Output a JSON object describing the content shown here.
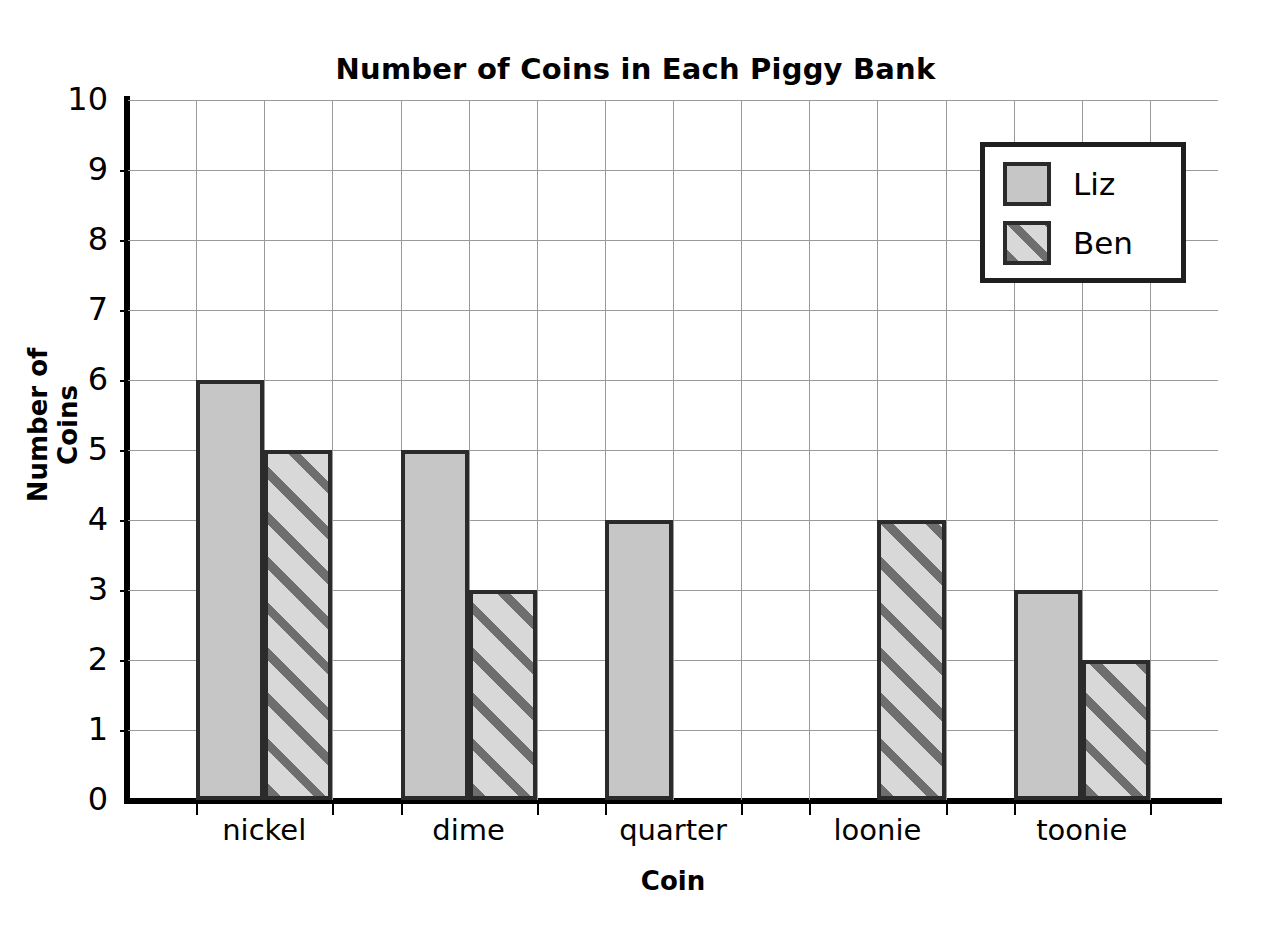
{
  "chart_data": {
    "type": "bar",
    "title": "Number of Coins in Each Piggy Bank",
    "xlabel": "Coin",
    "ylabel": "Number of Coins",
    "categories": [
      "nickel",
      "dime",
      "quarter",
      "loonie",
      "toonie"
    ],
    "series": [
      {
        "name": "Liz",
        "values": [
          6,
          5,
          4,
          0,
          3
        ],
        "fill": "solid",
        "color": "#c6c6c6"
      },
      {
        "name": "Ben",
        "values": [
          5,
          3,
          0,
          4,
          2
        ],
        "fill": "diagonal-hatch",
        "color": "#d8d8d8"
      }
    ],
    "ylim": [
      0,
      10
    ],
    "ytick_labels": [
      "0",
      "1",
      "2",
      "3",
      "4",
      "5",
      "6",
      "7",
      "8",
      "9",
      "10"
    ],
    "ytick_step": 1,
    "grid": true,
    "legend_position": "top-right",
    "bar_outline_color": "#2b2b2b",
    "grid_color": "#9a9a9a",
    "axis_color": "#000000"
  },
  "legend": {
    "entries": [
      {
        "label": "Liz"
      },
      {
        "label": "Ben"
      }
    ]
  }
}
